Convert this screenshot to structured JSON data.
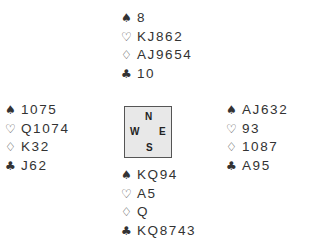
{
  "icons": {
    "spade": "♠",
    "heart": "♡",
    "diamond": "♢",
    "club": "♣"
  },
  "compass": {
    "north": "N",
    "south": "S",
    "west": "W",
    "east": "E"
  },
  "hands": {
    "north": {
      "spades": "8",
      "hearts": "KJ862",
      "diamonds": "AJ9654",
      "clubs": "10"
    },
    "west": {
      "spades": "1075",
      "hearts": "Q1074",
      "diamonds": "K32",
      "clubs": "J62"
    },
    "east": {
      "spades": "AJ632",
      "hearts": "93",
      "diamonds": "1087",
      "clubs": "A95"
    },
    "south": {
      "spades": "KQ94",
      "hearts": "A5",
      "diamonds": "Q",
      "clubs": "KQ8743"
    }
  },
  "colors": {
    "text": "#333333",
    "compass_bg": "#e8e8e8",
    "compass_border": "#555555"
  }
}
